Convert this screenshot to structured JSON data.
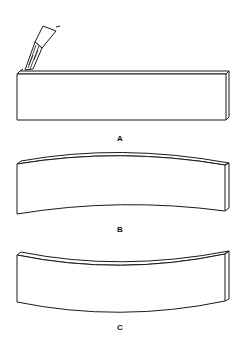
{
  "figure": {
    "panels": [
      {
        "id": "a",
        "label": "A",
        "description": "Straight bar being heated along top edge with torch"
      },
      {
        "id": "b",
        "label": "B",
        "description": "Bar bowed upward (convex top)"
      },
      {
        "id": "c",
        "label": "C",
        "description": "Bar bowed downward (concave top)"
      }
    ],
    "colors": {
      "line": "#1a1a1a",
      "background": "#ffffff"
    }
  }
}
